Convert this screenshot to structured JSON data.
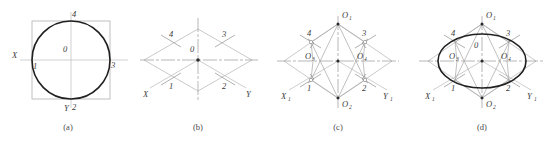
{
  "figure": {
    "panel_count": 4
  },
  "colors": {
    "heavy_line": "#202020",
    "light_line": "#bdbdbd",
    "construction_line": "#a5a5a5",
    "axis_line": "#bcbcbc",
    "label_text": "#3b3b3b",
    "background": "#ffffff"
  },
  "captions": [
    {
      "key": "a",
      "label": "(a)"
    },
    {
      "key": "b",
      "label": "(b)"
    },
    {
      "key": "c",
      "label": "(c)"
    },
    {
      "key": "d",
      "label": "(d)"
    }
  ],
  "panels": {
    "a": {
      "name": "circle-in-square",
      "description": "True circle inscribed in a square with orthographic X and Y axes",
      "labels": {
        "center": "0",
        "axis_x": "X",
        "axis_y": "Y",
        "p1": "1",
        "p2": "2",
        "p3": "3",
        "p4": "4"
      }
    },
    "b": {
      "name": "isometric-rhombus",
      "description": "Isometric rhombus replacing the square, with isometric axes and tangent point markers",
      "labels": {
        "center": "0",
        "axis_x": "X",
        "axis_y": "Y",
        "p1": "1",
        "p2": "2",
        "p3": "3",
        "p4": "4"
      }
    },
    "c": {
      "name": "arc-centers-located",
      "description": "Construction lines from obtuse corners locate the four arc centers",
      "labels": {
        "axis_x": "X",
        "axis_x_sub": "1",
        "axis_y": "Y",
        "axis_y_sub": "1",
        "o1": "O",
        "o1_sub": "1",
        "o2": "O",
        "o2_sub": "2",
        "o3": "O",
        "o3_sub": "3",
        "o4": "O",
        "o4_sub": "4",
        "p1": "1",
        "p2": "2",
        "p3": "3",
        "p4": "4"
      }
    },
    "d": {
      "name": "completed-ellipse",
      "description": "Four tangent arcs drawn from the located centers complete the isometric ellipse",
      "labels": {
        "axis_x": "X",
        "axis_x_sub": "1",
        "axis_y": "Y",
        "axis_y_sub": "1",
        "center": "0",
        "o1": "O",
        "o1_sub": "1",
        "o2": "O",
        "o2_sub": "2",
        "o3": "O",
        "o3_sub": "3",
        "o4": "O",
        "o4_sub": "4",
        "p1": "1",
        "p2": "2",
        "p3": "3",
        "p4": "4"
      }
    }
  }
}
